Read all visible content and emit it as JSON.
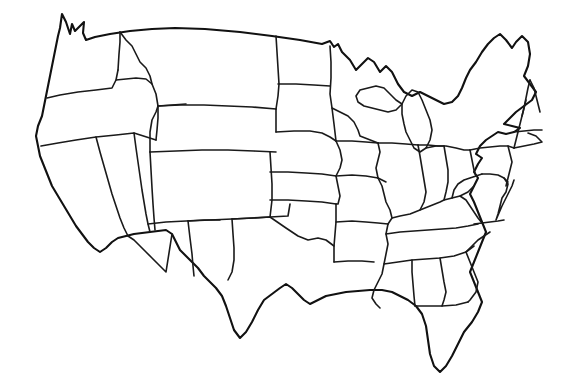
{
  "figure": {
    "kind": "map",
    "subtitle": "",
    "caption": "",
    "has_labels": false,
    "has_legend": false,
    "has_axes": false,
    "has_text": false,
    "projection_look": "hand-drawn sketch",
    "width_px": 563,
    "height_px": 381
  },
  "style": {
    "background_color": "#ffffff",
    "outline_color": "#1a1a1a",
    "fill_color": "#ffffff",
    "outer_stroke_color": "#111111",
    "stroke_width_px": 1.7,
    "outer_stroke_width_px": 2.1
  },
  "map_data": {
    "type": "choropleth_blank",
    "region": "United States (lower 48)",
    "unit": "state",
    "feature_count": 49,
    "values": [],
    "regions": [
      "Washington",
      "Oregon",
      "California",
      "Nevada",
      "Idaho",
      "Montana",
      "Wyoming",
      "Utah",
      "Arizona",
      "Colorado",
      "New Mexico",
      "North Dakota",
      "South Dakota",
      "Nebraska",
      "Kansas",
      "Oklahoma",
      "Texas",
      "Minnesota",
      "Iowa",
      "Missouri",
      "Arkansas",
      "Louisiana",
      "Wisconsin",
      "Illinois",
      "Michigan",
      "Indiana",
      "Ohio",
      "Kentucky",
      "Tennessee",
      "Mississippi",
      "Alabama",
      "Georgia",
      "Florida",
      "South Carolina",
      "North Carolina",
      "Virginia",
      "West Virginia",
      "Maryland",
      "Delaware",
      "Pennsylvania",
      "New Jersey",
      "New York",
      "Connecticut",
      "Rhode Island",
      "Massachusetts",
      "Vermont",
      "New Hampshire",
      "Maine",
      "District of Columbia"
    ],
    "notable_features": [
      "Puget Sound notch at northwest corner",
      "Florida peninsula extending south",
      "Texas panhandle",
      "Michigan upper and lower peninsulas",
      "Great Lakes shoreline",
      "Long Island and Cape Cod on northeast coast",
      "Chesapeake Bay indentation"
    ]
  }
}
